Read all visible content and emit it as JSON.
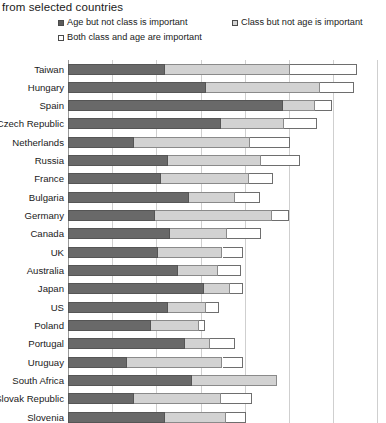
{
  "chart": {
    "title": "from selected countries",
    "type_label": "horizontal-stacked-bar"
  },
  "legend": {
    "items": [
      {
        "label": "Age but not class is important",
        "marker": "dark-square-swatch",
        "color": "#696969"
      },
      {
        "label": "Class but not age is important",
        "marker": "light-square-swatch",
        "color": "#d2d2d2"
      },
      {
        "label": "Both class and age are important",
        "marker": "white-square-swatch",
        "color": "#ffffff"
      }
    ]
  },
  "chart_data": {
    "type": "bar",
    "orientation": "horizontal",
    "stacked": true,
    "title": "from selected countries",
    "xlabel": "",
    "ylabel": "",
    "xlim": [
      0,
      100
    ],
    "grid": true,
    "gridlines_x": [
      0,
      14.3,
      28.6,
      42.9,
      57.2,
      71.5,
      85.8,
      100
    ],
    "legend_position": "top",
    "categories": [
      "Taiwan",
      "Hungary",
      "Spain",
      "Czech Republic",
      "Netherlands",
      "Russia",
      "France",
      "Bulgaria",
      "Germany",
      "Canada",
      "UK",
      "Australia",
      "Japan",
      "US",
      "Poland",
      "Portugal",
      "Uruguay",
      "South Africa",
      "Slovak Republic",
      "Slovenia",
      "Austria",
      "Finland"
    ],
    "series": [
      {
        "name": "Age but not class is important",
        "color": "#696969",
        "values": [
          31.5,
          44.5,
          69.5,
          49.5,
          21.5,
          32.5,
          30.0,
          39.0,
          28.0,
          33.0,
          29.0,
          35.5,
          44.0,
          32.5,
          27.0,
          38.0,
          19.0,
          40.0,
          21.5,
          31.5,
          15.0,
          29.0
        ]
      },
      {
        "name": "Class but not age is important",
        "color": "#d2d2d2",
        "values": [
          40.5,
          37.0,
          10.5,
          20.5,
          37.5,
          30.0,
          28.5,
          15.0,
          38.0,
          18.5,
          21.0,
          13.0,
          8.5,
          12.0,
          15.5,
          8.0,
          31.0,
          27.5,
          28.0,
          19.5,
          38.0,
          15.5
        ]
      },
      {
        "name": "Both class and age are important",
        "color": "#ffffff",
        "values": [
          21.5,
          11.0,
          5.5,
          10.5,
          13.0,
          12.5,
          8.0,
          8.0,
          5.5,
          11.0,
          6.5,
          7.5,
          4.0,
          4.5,
          2.0,
          8.0,
          6.5,
          0.0,
          10.0,
          6.5,
          0.0,
          5.5
        ]
      }
    ]
  }
}
